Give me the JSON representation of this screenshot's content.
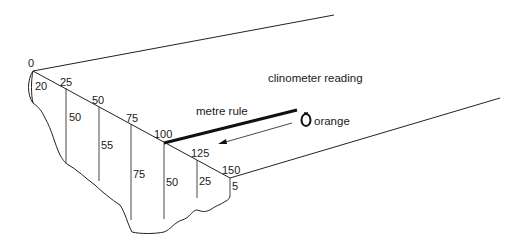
{
  "diagram": {
    "type": "river cross-section field sketch",
    "labels": {
      "clinometer": "clinometer reading",
      "metre_rule": "metre rule",
      "orange": "orange"
    },
    "distance_markers": [
      "0",
      "25",
      "50",
      "75",
      "100",
      "125",
      "150"
    ],
    "depth_readings": [
      "20",
      "50",
      "55",
      "75",
      "50",
      "25",
      "5"
    ],
    "colors": {
      "line": "#222222",
      "background": "#ffffff"
    }
  }
}
